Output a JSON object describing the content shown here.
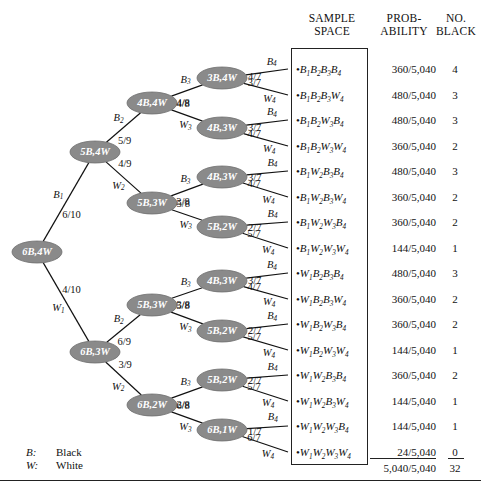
{
  "headers": {
    "sample_space": "SAMPLE\nSPACE",
    "probability": "PROB-\nABILITY",
    "no_black": "NO.\nBLACK"
  },
  "legend": [
    {
      "key": "B:",
      "value": "Black"
    },
    {
      "key": "W:",
      "value": "White"
    }
  ],
  "chart_data": {
    "type": "tree",
    "root": {
      "label": "6B,4W"
    },
    "level_labels": [
      "B",
      "W"
    ],
    "nodes": [
      {
        "id": "root",
        "label": "6B,4W",
        "x": 37,
        "y": 252
      },
      {
        "id": "b1",
        "label": "5B,4W",
        "x": 95,
        "y": 152
      },
      {
        "id": "w1",
        "label": "6B,3W",
        "x": 95,
        "y": 352
      },
      {
        "id": "b1b2",
        "label": "4B,4W",
        "x": 152,
        "y": 103
      },
      {
        "id": "b1w2",
        "label": "5B,3W",
        "x": 152,
        "y": 203
      },
      {
        "id": "w1b2",
        "label": "5B,3W",
        "x": 152,
        "y": 305
      },
      {
        "id": "w1w2",
        "label": "6B,2W",
        "x": 152,
        "y": 405
      },
      {
        "id": "b1b2b3",
        "label": "3B,4W",
        "x": 222,
        "y": 78
      },
      {
        "id": "b1b2w3",
        "label": "4B,3W",
        "x": 222,
        "y": 128
      },
      {
        "id": "b1w2b3",
        "label": "4B,3W",
        "x": 222,
        "y": 177
      },
      {
        "id": "b1w2w3",
        "label": "5B,2W",
        "x": 222,
        "y": 227
      },
      {
        "id": "w1b2b3",
        "label": "4B,3W",
        "x": 222,
        "y": 281
      },
      {
        "id": "w1b2w3",
        "label": "5B,2W",
        "x": 222,
        "y": 331
      },
      {
        "id": "w1w2b3",
        "label": "5B,2W",
        "x": 222,
        "y": 380
      },
      {
        "id": "w1w2w3",
        "label": "6B,1W",
        "x": 222,
        "y": 430
      }
    ],
    "edges": [
      {
        "from": "root",
        "to": "b1",
        "prob": "6/10",
        "label": "B",
        "sub": "1"
      },
      {
        "from": "root",
        "to": "w1",
        "prob": "4/10",
        "label": "W",
        "sub": "1"
      },
      {
        "from": "b1",
        "to": "b1b2",
        "prob": "5/9",
        "label": "B",
        "sub": "2"
      },
      {
        "from": "b1",
        "to": "b1w2",
        "prob": "4/9",
        "label": "W",
        "sub": "2"
      },
      {
        "from": "w1",
        "to": "w1b2",
        "prob": "6/9",
        "label": "B",
        "sub": "2"
      },
      {
        "from": "w1",
        "to": "w1w2",
        "prob": "3/9",
        "label": "W",
        "sub": "2"
      },
      {
        "from": "b1b2",
        "to": "b1b2b3",
        "prob": "4/8",
        "label": "B",
        "sub": "3"
      },
      {
        "from": "b1b2",
        "to": "b1b2w3",
        "prob": "4/8",
        "label": "W",
        "sub": "3"
      },
      {
        "from": "b1w2",
        "to": "b1w2b3",
        "prob": "5/8",
        "label": "B",
        "sub": "3"
      },
      {
        "from": "b1w2",
        "to": "b1w2w3",
        "prob": "3/8",
        "label": "W",
        "sub": "3"
      },
      {
        "from": "w1b2",
        "to": "w1b2b3",
        "prob": "5/8",
        "label": "B",
        "sub": "3"
      },
      {
        "from": "w1b2",
        "to": "w1b2w3",
        "prob": "3/8",
        "label": "W",
        "sub": "3"
      },
      {
        "from": "w1w2",
        "to": "w1w2b3",
        "prob": "6/8",
        "label": "B",
        "sub": "3"
      },
      {
        "from": "w1w2",
        "to": "w1w2w3",
        "prob": "2/8",
        "label": "W",
        "sub": "3"
      }
    ],
    "leaf_edges": [
      {
        "from": "b1b2b3",
        "prob": "3/7",
        "label": "B",
        "sub": "4"
      },
      {
        "from": "b1b2b3",
        "prob": "4/7",
        "label": "W",
        "sub": "4"
      },
      {
        "from": "b1b2w3",
        "prob": "4/7",
        "label": "B",
        "sub": "4"
      },
      {
        "from": "b1b2w3",
        "prob": "3/7",
        "label": "W",
        "sub": "4"
      },
      {
        "from": "b1w2b3",
        "prob": "4/7",
        "label": "B",
        "sub": "4"
      },
      {
        "from": "b1w2b3",
        "prob": "3/7",
        "label": "W",
        "sub": "4"
      },
      {
        "from": "b1w2w3",
        "prob": "5/7",
        "label": "B",
        "sub": "4"
      },
      {
        "from": "b1w2w3",
        "prob": "2/7",
        "label": "W",
        "sub": "4"
      },
      {
        "from": "w1b2b3",
        "prob": "4/7",
        "label": "B",
        "sub": "4"
      },
      {
        "from": "w1b2b3",
        "prob": "3/7",
        "label": "W",
        "sub": "4"
      },
      {
        "from": "w1b2w3",
        "prob": "5/7",
        "label": "B",
        "sub": "4"
      },
      {
        "from": "w1b2w3",
        "prob": "2/7",
        "label": "W",
        "sub": "4"
      },
      {
        "from": "w1w2b3",
        "prob": "5/7",
        "label": "B",
        "sub": "4"
      },
      {
        "from": "w1w2b3",
        "prob": "2/7",
        "label": "W",
        "sub": "4"
      },
      {
        "from": "w1w2w3",
        "prob": "6/7",
        "label": "B",
        "sub": "4"
      },
      {
        "from": "w1w2w3",
        "prob": "1/7",
        "label": "W",
        "sub": "4"
      }
    ],
    "outcomes": [
      {
        "sample_space": "B1B2B3B4",
        "probability": "360/5,040",
        "no_black": "4",
        "y": 62
      },
      {
        "sample_space": "B1B2B3W4",
        "probability": "480/5,040",
        "no_black": "3",
        "y": 88
      },
      {
        "sample_space": "B1B2W3B4",
        "probability": "480/5,040",
        "no_black": "3",
        "y": 113
      },
      {
        "sample_space": "B1B2W3W4",
        "probability": "360/5,040",
        "no_black": "2",
        "y": 139
      },
      {
        "sample_space": "B1W2B3B4",
        "probability": "480/5,040",
        "no_black": "3",
        "y": 164
      },
      {
        "sample_space": "B1W2B3W4",
        "probability": "360/5,040",
        "no_black": "2",
        "y": 190
      },
      {
        "sample_space": "B1W2W3B4",
        "probability": "360/5,040",
        "no_black": "2",
        "y": 215
      },
      {
        "sample_space": "B1W2W3W4",
        "probability": "144/5,040",
        "no_black": "1",
        "y": 241
      },
      {
        "sample_space": "W1B2B3B4",
        "probability": "480/5,040",
        "no_black": "3",
        "y": 266
      },
      {
        "sample_space": "W1B2B3W4",
        "probability": "360/5,040",
        "no_black": "2",
        "y": 292
      },
      {
        "sample_space": "W1B2W3B4",
        "probability": "360/5,040",
        "no_black": "2",
        "y": 317
      },
      {
        "sample_space": "W1B2W3W4",
        "probability": "144/5,040",
        "no_black": "1",
        "y": 343
      },
      {
        "sample_space": "W1W2B3B4",
        "probability": "360/5,040",
        "no_black": "2",
        "y": 368
      },
      {
        "sample_space": "W1W2B3W4",
        "probability": "144/5,040",
        "no_black": "1",
        "y": 394
      },
      {
        "sample_space": "W1W2W3B4",
        "probability": "144/5,040",
        "no_black": "1",
        "y": 419
      },
      {
        "sample_space": "W1W2W3W4",
        "probability": "24/5,040",
        "no_black": "0",
        "y": 445
      }
    ],
    "totals": {
      "probability": "5,040/5,040",
      "no_black": "32"
    }
  }
}
